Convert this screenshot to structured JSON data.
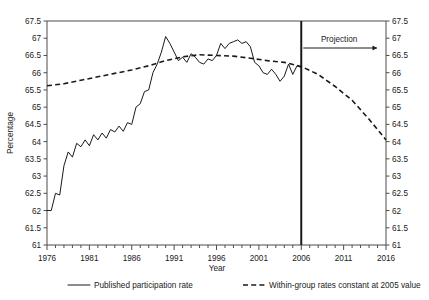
{
  "chart_data": {
    "type": "line",
    "title": "",
    "xlabel": "Year",
    "ylabel": "Percentage",
    "xlim": [
      1976,
      2016
    ],
    "ylim": [
      61,
      67.5
    ],
    "ytick_step": 0.5,
    "xtick_step": 5,
    "xminor_step": 1,
    "grid": false,
    "legend_position": "bottom",
    "xticks": [
      "1976",
      "1981",
      "1986",
      "1991",
      "1996",
      "2001",
      "2006",
      "2011",
      "2016"
    ],
    "yticks": [
      "61",
      "61.5",
      "62",
      "62.5",
      "63",
      "63.5",
      "64",
      "64.5",
      "65",
      "65.5",
      "66",
      "66.5",
      "67",
      "67.5"
    ],
    "annotations": [
      {
        "name": "projection-label",
        "text": "Projection",
        "x": 2009.5,
        "y": 67.25
      },
      {
        "name": "projection-divider",
        "text": "",
        "x": 2006,
        "y": 61
      }
    ],
    "series": [
      {
        "name": "Published participation rate",
        "style": "solid",
        "x": [
          1976,
          1976.5,
          1977,
          1977.5,
          1978,
          1978.5,
          1979,
          1979.5,
          1980,
          1980.5,
          1981,
          1981.5,
          1982,
          1982.5,
          1983,
          1983.5,
          1984,
          1984.5,
          1985,
          1985.5,
          1986,
          1986.5,
          1987,
          1987.5,
          1988,
          1988.5,
          1989,
          1989.5,
          1990,
          1990.5,
          1991,
          1991.5,
          1992,
          1992.5,
          1993,
          1993.5,
          1994,
          1994.5,
          1995,
          1995.5,
          1996,
          1996.5,
          1997,
          1997.5,
          1998,
          1998.5,
          1999,
          1999.5,
          2000,
          2000.5,
          2001,
          2001.5,
          2002,
          2002.5,
          2003,
          2003.5,
          2004,
          2004.5,
          2005,
          2005.5,
          2006
        ],
        "values": [
          62.0,
          62.0,
          62.5,
          62.45,
          63.3,
          63.7,
          63.55,
          63.95,
          63.85,
          64.05,
          63.88,
          64.2,
          64.05,
          64.25,
          64.1,
          64.35,
          64.28,
          64.45,
          64.3,
          64.55,
          64.5,
          65.0,
          65.1,
          65.45,
          65.5,
          66.0,
          66.25,
          66.6,
          67.05,
          66.85,
          66.6,
          66.35,
          66.45,
          66.3,
          66.55,
          66.45,
          66.3,
          66.25,
          66.4,
          66.35,
          66.5,
          66.85,
          66.7,
          66.85,
          66.9,
          66.95,
          66.85,
          66.9,
          66.75,
          66.3,
          66.2,
          66.0,
          65.95,
          66.1,
          65.95,
          65.75,
          65.9,
          66.25,
          65.95,
          66.2,
          66.15
        ]
      },
      {
        "name": "Within-group rates constant at 2005 value",
        "style": "dashed",
        "x": [
          1976,
          1978,
          1980,
          1982,
          1984,
          1986,
          1988,
          1990,
          1992,
          1994,
          1996,
          1998,
          2000,
          2002,
          2004,
          2006,
          2008,
          2010,
          2012,
          2014,
          2016
        ],
        "values": [
          65.62,
          65.68,
          65.78,
          65.88,
          65.98,
          66.08,
          66.2,
          66.35,
          66.46,
          66.52,
          66.5,
          66.48,
          66.42,
          66.35,
          66.3,
          66.18,
          65.95,
          65.6,
          65.2,
          64.65,
          64.05
        ]
      }
    ],
    "legend": [
      {
        "label": "Published participation rate",
        "style": "solid"
      },
      {
        "label": "Within-group rates constant at 2005 value",
        "style": "dashed"
      }
    ]
  },
  "colors": {
    "series_line": "#1a1a1a",
    "axis": "#4d4d4d",
    "background": "#ffffff"
  }
}
